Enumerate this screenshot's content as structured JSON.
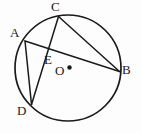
{
  "figure": {
    "width": 141,
    "height": 133,
    "background_color": "#fdfdfd",
    "stroke_color": "#1a1a1a",
    "label_color": "#1a1a1a"
  },
  "chart_data": {
    "type": "diagram",
    "subtype": "euclidean-geometry",
    "circle": {
      "name": "circle-O",
      "center_label": "O",
      "center": {
        "x": 68,
        "y": 68
      },
      "radius": 53,
      "stroke": "#1a1a1a",
      "stroke_width": 1.7,
      "fill": "none"
    },
    "center_dot": {
      "name": "center-dot",
      "x": 69.5,
      "y": 67.5,
      "r": 2.2
    },
    "points": [
      {
        "id": "A",
        "label": "A",
        "x": 25.0,
        "y": 41.0,
        "label_x": 10,
        "label_y": 26
      },
      {
        "id": "B",
        "label": "B",
        "x": 119.5,
        "y": 71.5,
        "label_x": 122,
        "label_y": 63
      },
      {
        "id": "C",
        "label": "C",
        "x": 58.5,
        "y": 16.5,
        "label_x": 51,
        "label_y": 0
      },
      {
        "id": "D",
        "label": "D",
        "x": 31.5,
        "y": 104.5,
        "label_x": 17,
        "label_y": 104
      },
      {
        "id": "E",
        "label": "E",
        "x": 45.0,
        "y": 52.0,
        "label_x": 44,
        "label_y": 53
      },
      {
        "id": "O",
        "label": "O",
        "x": 68.0,
        "y": 68.0,
        "label_x": 55,
        "label_y": 64
      }
    ],
    "segments": [
      {
        "name": "chord-AB",
        "from": "A",
        "to": "B",
        "x1": 25.0,
        "y1": 41.0,
        "x2": 119.5,
        "y2": 71.5
      },
      {
        "name": "chord-CD",
        "from": "C",
        "to": "D",
        "x1": 58.5,
        "y1": 16.5,
        "x2": 31.5,
        "y2": 104.5
      },
      {
        "name": "chord-CB",
        "from": "C",
        "to": "B",
        "x1": 58.5,
        "y1": 16.5,
        "x2": 119.5,
        "y2": 71.5
      },
      {
        "name": "chord-AD",
        "from": "A",
        "to": "D",
        "x1": 25.0,
        "y1": 41.0,
        "x2": 31.5,
        "y2": 104.5
      }
    ],
    "intersection": {
      "name": "intersection-E",
      "label": "E",
      "of": [
        "chord-AB",
        "chord-CD"
      ],
      "x": 45.0,
      "y": 52.0
    }
  }
}
